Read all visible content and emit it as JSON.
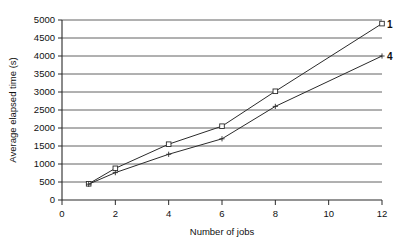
{
  "chart_data": {
    "type": "line",
    "title": "",
    "xlabel": "Number of jobs",
    "ylabel": "Average elapsed time (s)",
    "xlim": [
      0,
      12
    ],
    "ylim": [
      0,
      5000
    ],
    "xticks": [
      0,
      2,
      4,
      6,
      8,
      10,
      12
    ],
    "yticks": [
      0,
      500,
      1000,
      1500,
      2000,
      2500,
      3000,
      3500,
      4000,
      4500,
      5000
    ],
    "xtick_labels": [
      "0",
      "2",
      "4",
      "6",
      "8",
      "10",
      "12"
    ],
    "ytick_labels": [
      "0",
      "500",
      "1000",
      "1500",
      "2000",
      "2500",
      "3000",
      "3500",
      "4000",
      "4500",
      "5000"
    ],
    "grid": true,
    "grid_axis": "y",
    "legend": "endpoint-labels",
    "legend_position": "right-of-line-ends",
    "series": [
      {
        "name": "1",
        "label": "1",
        "marker": "square",
        "color": "#2b2b2b",
        "x": [
          1,
          2,
          4,
          6,
          8,
          12
        ],
        "values": [
          450,
          880,
          1550,
          2050,
          3020,
          4900
        ]
      },
      {
        "name": "4",
        "label": "4",
        "marker": "plus",
        "color": "#2b2b2b",
        "x": [
          1,
          2,
          4,
          6,
          8,
          12
        ],
        "values": [
          440,
          760,
          1270,
          1700,
          2600,
          4000
        ]
      }
    ]
  },
  "figure": {
    "background_color": "#ffffff",
    "axis_color": "#2a2a2a",
    "grid_color": "#3a3a3a"
  }
}
